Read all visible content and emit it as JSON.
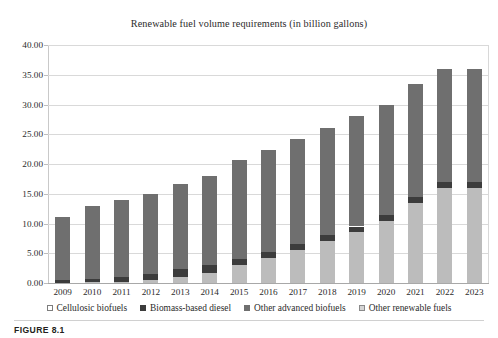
{
  "figure": {
    "caption": "FIGURE 8.1"
  },
  "chart_data": {
    "type": "bar",
    "subtype": "stacked-bar",
    "title": "Renewable fuel volume requirements (in billion gallons)",
    "xlabel": "",
    "ylabel": "",
    "ylim": [
      0,
      40
    ],
    "ytick_labels": [
      "0.00",
      "5.00",
      "10.00",
      "15.00",
      "20.00",
      "25.00",
      "30.00",
      "35.00",
      "40.00"
    ],
    "ytick_values": [
      0,
      5,
      10,
      15,
      20,
      25,
      30,
      35,
      40
    ],
    "grid": true,
    "grid_axis": "y",
    "legend_position": "bottom",
    "categories": [
      "2009",
      "2010",
      "2011",
      "2012",
      "2013",
      "2014",
      "2015",
      "2016",
      "2017",
      "2018",
      "2019",
      "2020",
      "2021",
      "2022",
      "2023"
    ],
    "series": [
      {
        "name": "Cellulosic biofuels",
        "color": "#bcbcbc",
        "values": [
          0.0,
          0.1,
          0.25,
          0.5,
          1.0,
          1.75,
          3.0,
          4.25,
          5.5,
          7.0,
          8.5,
          10.5,
          13.5,
          16.0,
          16.0
        ]
      },
      {
        "name": "Biomass-based diesel",
        "color": "#3c3c3c",
        "values": [
          0.5,
          0.65,
          0.8,
          1.0,
          1.28,
          1.28,
          1.0,
          1.0,
          1.0,
          1.0,
          1.0,
          1.0,
          1.0,
          1.0,
          1.0
        ]
      },
      {
        "name": "Other advanced biofuels",
        "color": "#6f6f6f",
        "values": [
          0.1,
          0.15,
          0.3,
          0.5,
          0.75,
          1.0,
          1.5,
          2.0,
          2.5,
          3.0,
          3.5,
          4.0,
          4.5,
          4.5,
          4.5
        ]
      },
      {
        "name": "Other renewable fuels",
        "color": "#6f6f6f",
        "values": [
          10.5,
          12.1,
          12.65,
          13.0,
          13.62,
          13.97,
          15.1,
          15.15,
          15.2,
          15.1,
          15.0,
          14.5,
          14.5,
          14.5,
          14.5
        ]
      }
    ],
    "totals": [
      11.1,
      13.0,
      14.0,
      15.0,
      16.65,
      18.0,
      20.6,
      22.4,
      24.2,
      26.1,
      28.0,
      30.0,
      33.5,
      36.0,
      36.0
    ]
  }
}
